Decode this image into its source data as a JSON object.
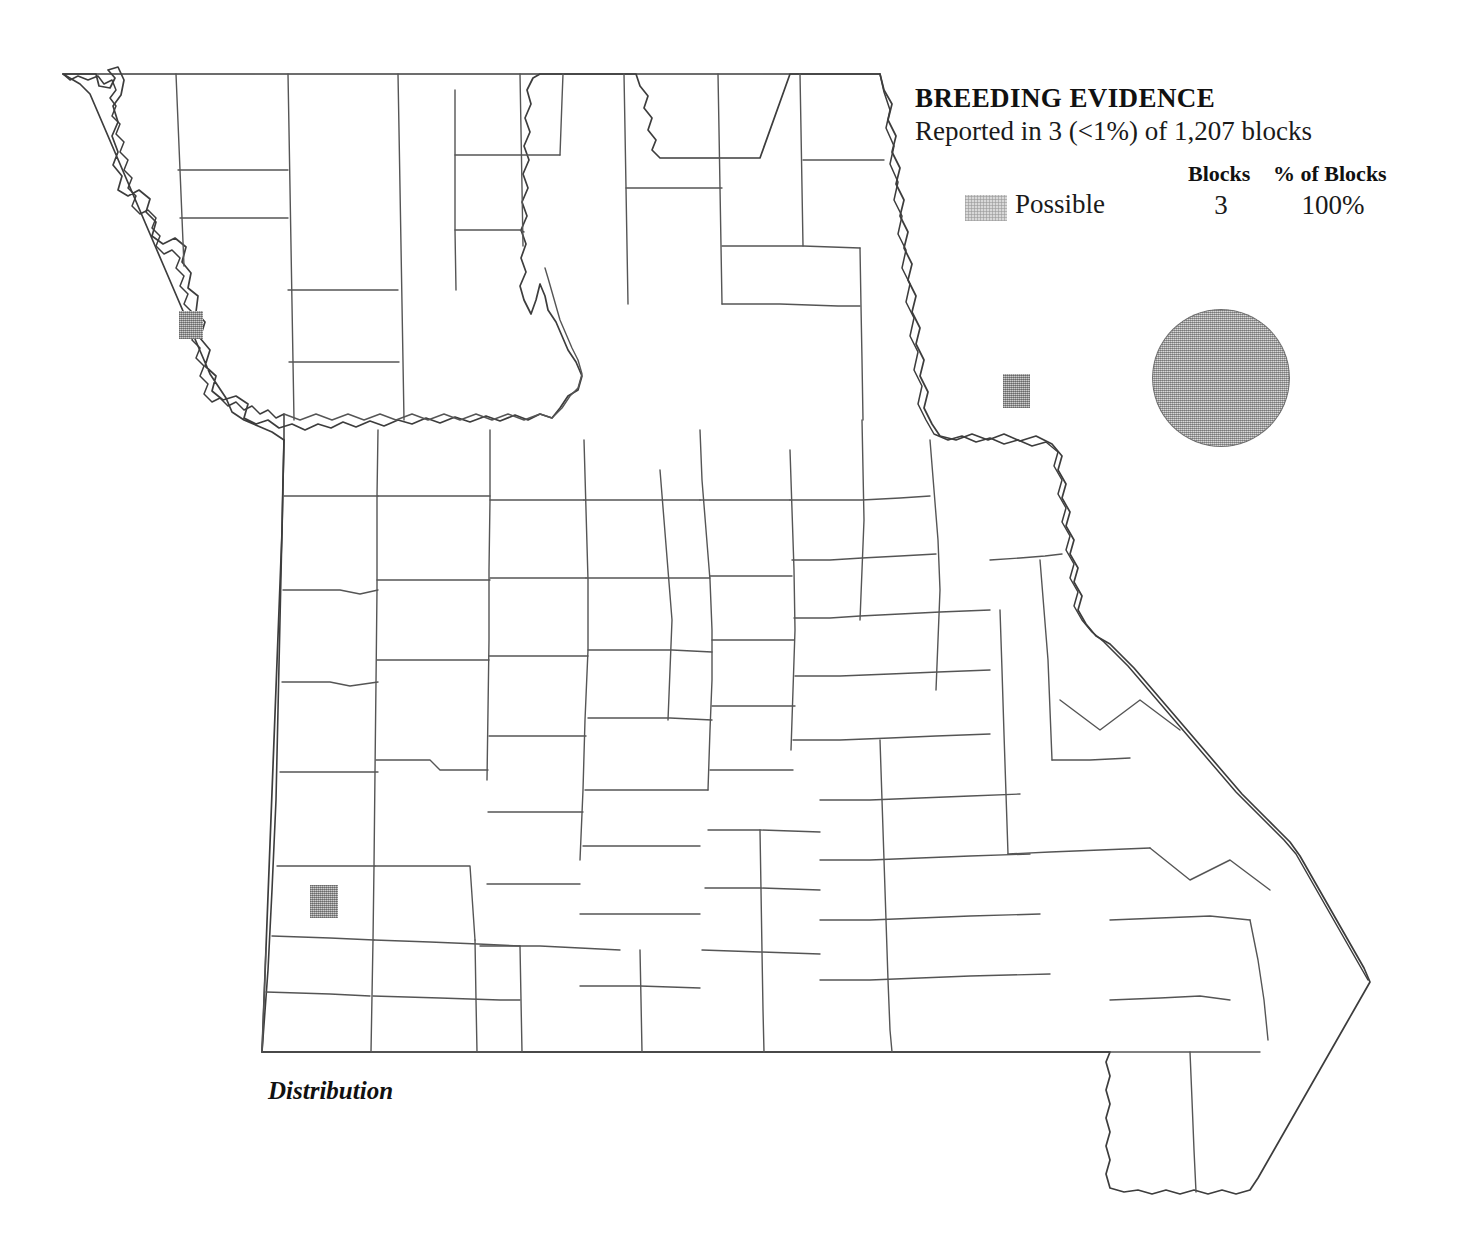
{
  "legend": {
    "title": "BREEDING EVIDENCE",
    "subtitle": "Reported in 3 (<1%) of 1,207 blocks",
    "columns": {
      "blocks_header": "Blocks",
      "percent_header": "% of Blocks"
    },
    "rows": [
      {
        "swatch_name": "possible-swatch",
        "label": "Possible",
        "blocks": "3",
        "percent": "100%",
        "color": "#d8d8d8"
      }
    ]
  },
  "caption": {
    "text": "Distribution"
  },
  "range_circle": {
    "name": "range-circle",
    "color": "#a3a3a3",
    "outline_color": "#6e6e6e",
    "center_x": 1221,
    "center_y": 378,
    "diameter": 138
  },
  "map": {
    "region": "Missouri",
    "outline_color": "#4a4a4a",
    "county_line_color": "#555555",
    "background": "#ffffff",
    "blocks": [
      {
        "id": "block-northwest",
        "x": 179,
        "y": 311,
        "width": 24,
        "height": 28,
        "color": "#999999"
      },
      {
        "id": "block-northeast",
        "x": 1003,
        "y": 374,
        "width": 27,
        "height": 34,
        "color": "#999999"
      },
      {
        "id": "block-southwest",
        "x": 310,
        "y": 885,
        "width": 28,
        "height": 33,
        "color": "#999999"
      }
    ]
  },
  "chart_data": {
    "type": "map",
    "title": "BREEDING EVIDENCE",
    "subtitle": "Reported in 3 (<1%) of 1,207 blocks",
    "caption": "Distribution",
    "total_blocks": 1207,
    "reported_blocks": 3,
    "reported_percent_of_total": "<1%",
    "categories": [
      "Possible"
    ],
    "values": [
      3
    ],
    "percent_values": [
      "100%"
    ],
    "legend_position": "top-right",
    "region": "Missouri counties"
  }
}
